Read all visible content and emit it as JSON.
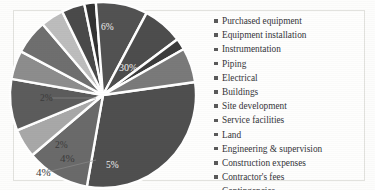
{
  "chart_data": {
    "type": "pie",
    "title": "",
    "xlabel": "",
    "ylabel": "",
    "legend_position": "right",
    "grid": false,
    "start_angle_deg": -8,
    "direction": "clockwise",
    "categories": [
      "Purchased equipment",
      "Equipment installation",
      "Instrumentation",
      "Piping",
      "Electrical",
      "Buildings",
      "Site development",
      "Service facilities",
      "Land",
      "Engineering & supervision",
      "Construction expenses",
      "Contractor's fees",
      "Contingencies"
    ],
    "slices": [
      {
        "label": "Purchased equipment",
        "value": 30,
        "display": "30%",
        "color": "#4f4f4f",
        "label_shown": true,
        "label_kind": "inside"
      },
      {
        "label": "Equipment installation",
        "value": 11,
        "display": "",
        "color": "#6a6a6a",
        "label_shown": false,
        "label_kind": "none"
      },
      {
        "label": "Instrumentation",
        "value": 5,
        "display": "5%",
        "color": "#a8a8a8",
        "label_shown": true,
        "label_kind": "inside"
      },
      {
        "label": "Piping",
        "value": 9,
        "display": "",
        "color": "#5c5c5c",
        "label_shown": false,
        "label_kind": "none"
      },
      {
        "label": "Electrical",
        "value": 5,
        "display": "",
        "color": "#8d8d8d",
        "label_shown": false,
        "label_kind": "none"
      },
      {
        "label": "Buildings",
        "value": 6,
        "display": "",
        "color": "#6f6f6f",
        "label_shown": false,
        "label_kind": "none"
      },
      {
        "label": "Site development",
        "value": 4,
        "display": "4%",
        "color": "#bdbdbd",
        "label_shown": true,
        "label_kind": "outside"
      },
      {
        "label": "Service facilities",
        "value": 4,
        "display": "4%",
        "color": "#4a4a4a",
        "label_shown": true,
        "label_kind": "outside"
      },
      {
        "label": "Land",
        "value": 2,
        "display": "2%",
        "color": "#333333",
        "label_shown": true,
        "label_kind": "outside"
      },
      {
        "label": "Engineering & supervision",
        "value": 9,
        "display": "",
        "color": "#525252",
        "label_shown": false,
        "label_kind": "none"
      },
      {
        "label": "Construction expenses",
        "value": 7,
        "display": "",
        "color": "#4d4d4d",
        "label_shown": false,
        "label_kind": "none"
      },
      {
        "label": "Contractor's fees",
        "value": 2,
        "display": "2%",
        "color": "#3c3c3c",
        "label_shown": true,
        "label_kind": "outside"
      },
      {
        "label": "Contingencies",
        "value": 6,
        "display": "6%",
        "color": "#7a7a7a",
        "label_shown": true,
        "label_kind": "inside"
      }
    ],
    "visible_labels": [
      "30%",
      "6%",
      "2%",
      "2%",
      "4%",
      "4%",
      "5%"
    ]
  },
  "labels": {
    "top_six": "6%",
    "left_two": "2%",
    "mid_two": "2%",
    "outer_four_upper": "4%",
    "outer_four_lower": "4%",
    "bottom_five": "5%",
    "big_slice": "30%"
  },
  "legend": {
    "items": [
      {
        "label": "Purchased equipment"
      },
      {
        "label": "Equipment installation"
      },
      {
        "label": "Instrumentation"
      },
      {
        "label": "Piping"
      },
      {
        "label": "Electrical"
      },
      {
        "label": "Buildings"
      },
      {
        "label": "Site development"
      },
      {
        "label": "Service facilities"
      },
      {
        "label": "Land"
      },
      {
        "label": "Engineering & supervision"
      },
      {
        "label": "Construction expenses"
      },
      {
        "label": "Contractor's fees"
      },
      {
        "label": "Contingencies"
      }
    ]
  },
  "colors": {
    "background": "#fdfdfc",
    "frame": "#e2e2de",
    "separator": "#ffffff",
    "legend_text": "#35353a",
    "legend_bullet": "#5a5a5a",
    "label_text": "#3b3b3b",
    "label_text_inside": "#efefef"
  }
}
